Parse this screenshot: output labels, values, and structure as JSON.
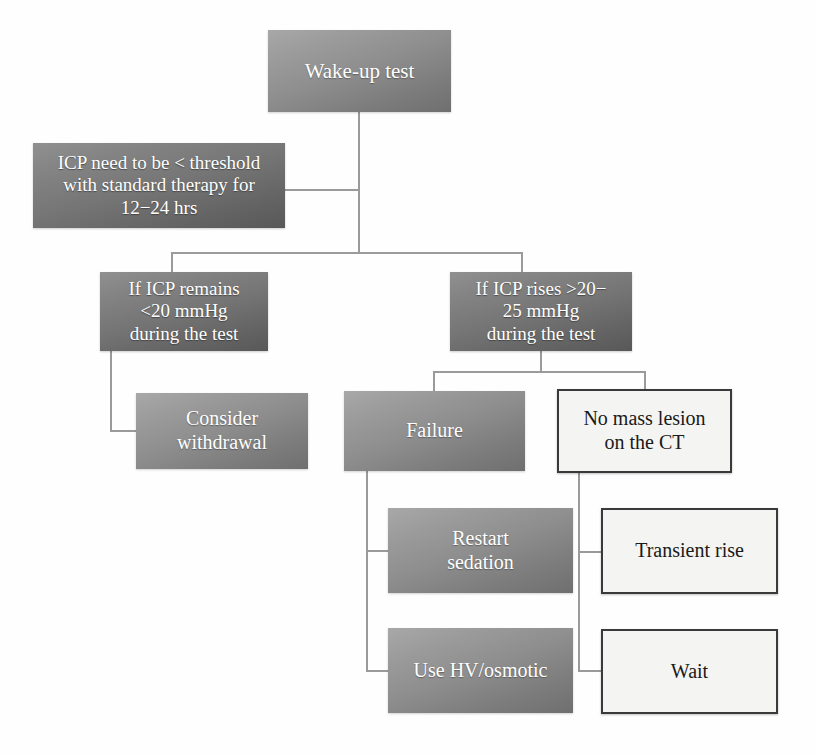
{
  "diagram": {
    "type": "flowchart",
    "palette": {
      "filled_light_start": "#a8a8a8",
      "filled_light_end": "#6f6f6f",
      "filled_dark_start": "#909090",
      "filled_dark_end": "#585858",
      "outlined_fill": "#f4f4f2",
      "outlined_border": "#3a3a3a",
      "connector": "#9a9a9a",
      "filled_text": "#ffffff",
      "outlined_text": "#1a1a1a",
      "background": "#ffffff"
    },
    "nodes": [
      {
        "id": "wake-up-test",
        "label": "Wake-up test",
        "style": "filled"
      },
      {
        "id": "icp-threshold",
        "label": "ICP need to be < threshold\nwith standard therapy for\n12−24 hrs",
        "style": "filled-dark"
      },
      {
        "id": "icp-remains",
        "label": "If ICP remains\n<20 mmHg\nduring the test",
        "style": "filled-dark"
      },
      {
        "id": "icp-rises",
        "label": "If ICP rises >20−\n25 mmHg\nduring the test",
        "style": "filled-dark"
      },
      {
        "id": "consider-withdrawal",
        "label": "Consider\nwithdrawal",
        "style": "filled"
      },
      {
        "id": "failure",
        "label": "Failure",
        "style": "filled"
      },
      {
        "id": "no-mass-lesion",
        "label": "No mass lesion\non the CT",
        "style": "outlined"
      },
      {
        "id": "restart-sedation",
        "label": "Restart\nsedation",
        "style": "filled"
      },
      {
        "id": "transient-rise",
        "label": "Transient rise",
        "style": "outlined"
      },
      {
        "id": "use-hv-osmotic",
        "label": "Use HV/osmotic",
        "style": "filled"
      },
      {
        "id": "wait",
        "label": "Wait",
        "style": "outlined"
      }
    ],
    "edges": [
      {
        "from": "wake-up-test",
        "to": "icp-threshold"
      },
      {
        "from": "wake-up-test",
        "to": "icp-remains"
      },
      {
        "from": "wake-up-test",
        "to": "icp-rises"
      },
      {
        "from": "icp-remains",
        "to": "consider-withdrawal"
      },
      {
        "from": "icp-rises",
        "to": "failure"
      },
      {
        "from": "icp-rises",
        "to": "no-mass-lesion"
      },
      {
        "from": "failure",
        "to": "restart-sedation"
      },
      {
        "from": "failure",
        "to": "use-hv-osmotic"
      },
      {
        "from": "no-mass-lesion",
        "to": "transient-rise"
      },
      {
        "from": "no-mass-lesion",
        "to": "wait"
      }
    ]
  }
}
